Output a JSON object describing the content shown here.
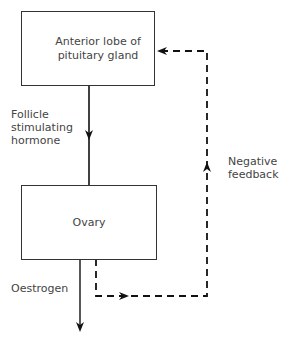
{
  "diagram": {
    "nodes": [
      {
        "id": "pituitary",
        "label": "Anterior lobe of\npituitary\ngland"
      },
      {
        "id": "ovary",
        "label": "Ovary"
      }
    ],
    "edges": [
      {
        "from": "pituitary",
        "to": "ovary",
        "label": "Follicle\nstimulating\nhormone",
        "style": "solid"
      },
      {
        "from": "ovary",
        "to": "output",
        "label": "Oestrogen",
        "style": "solid"
      },
      {
        "from": "ovary",
        "to": "pituitary",
        "label": "Negative\nfeedback",
        "style": "dashed"
      }
    ]
  },
  "labels": {
    "pituitary": "Anterior lobe of pituitary gland",
    "ovary": "Ovary",
    "fsh_line1": "Follicle",
    "fsh_line2": "stimulating",
    "fsh_line3": "hormone",
    "oestrogen": "Oestrogen",
    "feedback_line1": "Negative",
    "feedback_line2": "feedback"
  }
}
